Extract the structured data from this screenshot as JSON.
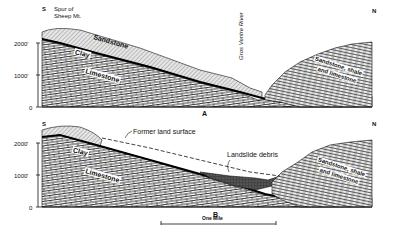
{
  "section_a": {
    "label": "A",
    "south": "S",
    "north": "N",
    "spur_line1": "Spur of",
    "spur_line2": "Sheep Mt.",
    "river": "Gros Ventre River",
    "layers": {
      "sandstone": "Sandstone",
      "clay": "Clay",
      "limestone": "Limestone",
      "north_line1": "Sandstone, shale",
      "north_line2": "and limestone"
    },
    "axis": {
      "tick_2000": "2000'",
      "tick_1000": "1000'",
      "tick_0": "0"
    }
  },
  "section_b": {
    "label": "B",
    "south": "S",
    "north": "N",
    "former_surface": "Former land surface",
    "landslide": "Landslide debris",
    "layers": {
      "clay": "Clay",
      "limestone": "Limestone",
      "north_line1": "Sandstone, shale",
      "north_line2": "and limestone"
    },
    "axis": {
      "tick_2000": "2000'",
      "tick_1000": "1000'",
      "tick_0": "0"
    }
  },
  "scale": {
    "label": "One Mile"
  }
}
